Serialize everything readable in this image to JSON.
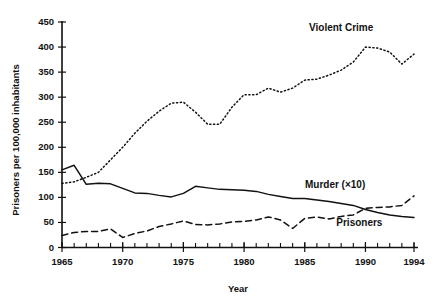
{
  "chart_data": {
    "type": "line",
    "title": "",
    "xlabel": "Year",
    "ylabel": "Prisoners per 100,000 inhabitants",
    "xlim": [
      1965,
      1994
    ],
    "ylim": [
      0,
      450
    ],
    "ytick_step": 50,
    "yticks": [
      0,
      50,
      100,
      150,
      200,
      250,
      300,
      350,
      400,
      450
    ],
    "ytick_labels": [
      "0",
      "50",
      "100",
      "150",
      "200",
      "250",
      "300",
      "350",
      "400",
      "450"
    ],
    "xticks_major": [
      1965,
      1970,
      1975,
      1980,
      1985,
      1990,
      1994
    ],
    "xtick_labels": [
      "1965",
      "1970",
      "1975",
      "1980",
      "1985",
      "1990",
      "1994"
    ],
    "xtick_minor_step": 1,
    "grid": false,
    "legend_position": "inline-annotations",
    "x": [
      1965,
      1966,
      1967,
      1968,
      1969,
      1970,
      1971,
      1972,
      1973,
      1974,
      1975,
      1976,
      1977,
      1978,
      1979,
      1980,
      1981,
      1982,
      1983,
      1984,
      1985,
      1986,
      1987,
      1988,
      1989,
      1990,
      1991,
      1992,
      1993,
      1994
    ],
    "series": [
      {
        "name": "Violent Crime",
        "style": "dotted",
        "label": "Violent Crime",
        "label_x": 1988.0,
        "label_y": 432,
        "values": [
          128,
          131,
          140,
          150,
          175,
          200,
          228,
          252,
          272,
          288,
          290,
          270,
          246,
          246,
          280,
          305,
          305,
          318,
          310,
          318,
          334,
          336,
          344,
          354,
          370,
          400,
          398,
          390,
          366,
          386
        ]
      },
      {
        "name": "Prisoners",
        "style": "solid",
        "label": "Prisoners",
        "label_x": 1989.5,
        "label_y": 42,
        "values": [
          155,
          164,
          126,
          128,
          127,
          118,
          109,
          108,
          104,
          101,
          108,
          122,
          119,
          116,
          115,
          114,
          112,
          106,
          102,
          98,
          98,
          95,
          92,
          88,
          84,
          76,
          70,
          65,
          62,
          60
        ]
      },
      {
        "name": "Murder (×10)",
        "style": "dashed",
        "label": "Murder (×10)",
        "label_x": 1987.5,
        "label_y": 118,
        "values": [
          24,
          30,
          32,
          32,
          37,
          20,
          28,
          33,
          42,
          47,
          53,
          46,
          45,
          47,
          51,
          52,
          55,
          61,
          55,
          38,
          58,
          61,
          57,
          62,
          65,
          78,
          80,
          81,
          84,
          103
        ]
      }
    ]
  },
  "axes": {
    "y_axis_title": "Prisoners per 100,000 inhabitants",
    "x_axis_title": "Year"
  }
}
